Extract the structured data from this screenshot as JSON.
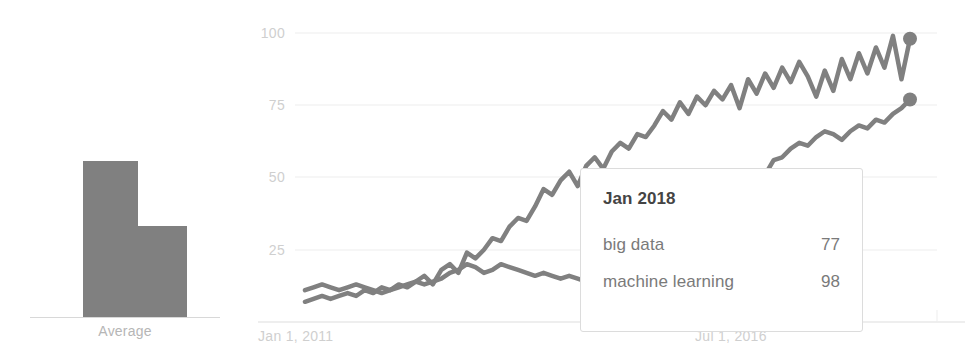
{
  "chart_data": [
    {
      "type": "bar",
      "title": "",
      "categories": [
        "big data",
        "machine learning"
      ],
      "values": [
        51,
        30
      ],
      "axis_label": "Average",
      "xlabel": "",
      "ylabel": "",
      "ylim": [
        0,
        100
      ],
      "grid": false,
      "legend": "none",
      "bar_color": "#808080"
    },
    {
      "type": "line",
      "title": "",
      "xlabel": "",
      "ylabel": "",
      "ylim": [
        0,
        100
      ],
      "ytick_labels": [
        "100",
        "75",
        "50",
        "25"
      ],
      "ytick_values": [
        100,
        75,
        50,
        25
      ],
      "xtick_labels": [
        "Jan 1, 2011",
        "Jul 1, 2016"
      ],
      "grid": true,
      "legend": "none",
      "line_color": "#808080",
      "series": [
        {
          "name": "big data",
          "end_marker_value": 77,
          "values": [
            11,
            12,
            13,
            12,
            11,
            12,
            13,
            12,
            11,
            10,
            11,
            12,
            13,
            14,
            13,
            14,
            15,
            17,
            18,
            20,
            19,
            17,
            18,
            20,
            19,
            18,
            17,
            16,
            17,
            16,
            15,
            16,
            15,
            14,
            15,
            16,
            15,
            16,
            17,
            16,
            15,
            16,
            17,
            18,
            19,
            20,
            22,
            26,
            32,
            38,
            44,
            42,
            47,
            52,
            51,
            56,
            57,
            60,
            62,
            61,
            64,
            66,
            65,
            63,
            66,
            68,
            67,
            70,
            69,
            72,
            74,
            77
          ]
        },
        {
          "name": "machine learning",
          "end_marker_value": 98,
          "values": [
            7,
            8,
            9,
            8,
            9,
            10,
            9,
            11,
            10,
            12,
            11,
            13,
            12,
            14,
            16,
            13,
            18,
            20,
            17,
            24,
            22,
            25,
            29,
            28,
            33,
            36,
            35,
            40,
            46,
            44,
            49,
            52,
            47,
            54,
            57,
            53,
            59,
            62,
            60,
            65,
            64,
            68,
            73,
            70,
            76,
            72,
            78,
            75,
            80,
            77,
            82,
            74,
            84,
            79,
            86,
            81,
            88,
            83,
            90,
            85,
            78,
            87,
            80,
            91,
            84,
            93,
            86,
            95,
            88,
            99,
            84,
            98
          ]
        }
      ]
    }
  ],
  "average_panel": {
    "axis_label": "Average"
  },
  "line_panel": {
    "ytick_labels": [
      "100",
      "75",
      "50",
      "25"
    ],
    "xtick_left": "Jan 1, 2011",
    "xtick_right": "Jul 1, 2016"
  },
  "tooltip": {
    "title": "Jan 2018",
    "rows": [
      {
        "label": "big data",
        "value": "77"
      },
      {
        "label": "machine learning",
        "value": "98"
      }
    ]
  },
  "colors": {
    "series": "#808080",
    "bar": "#808080",
    "grid": "#ededed",
    "tick_text": "#cfcfcf",
    "tooltip_title": "#444444",
    "tooltip_text": "#7a7a7a"
  }
}
